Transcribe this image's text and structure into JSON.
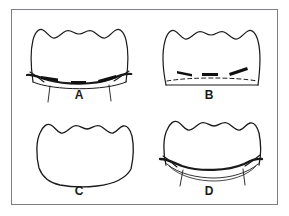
{
  "figure": {
    "layout": "2x2-panel-grid",
    "background_color": "#ffffff",
    "border_color": "#7c7f84",
    "ink_color": "#1a1a1a",
    "panels": [
      {
        "id": "a",
        "label": "A",
        "description": "Arch-shaped outline with wavy scalloped top border, crossed by a heavy dark curved band near the base with three short thick black segments and two vertical tick lines descending below",
        "features": [
          "scalloped-crest-outline",
          "heavy-curved-band",
          "three-thick-black-marks",
          "two-descending-tick-lines"
        ]
      },
      {
        "id": "b",
        "label": "B",
        "description": "Arch-shaped outline with wavy scalloped top border and a flat base, with a horizontal dashed line just above the base and three short thick black angled marks above the dashed line",
        "features": [
          "scalloped-crest-outline",
          "flat-base",
          "dashed-horizontal-line",
          "three-thick-black-marks"
        ]
      },
      {
        "id": "c",
        "label": "C",
        "description": "Plain arch-shaped outline with wavy scalloped top border and a gently curved lower border, with no internal markings",
        "features": [
          "scalloped-crest-outline",
          "plain-unmarked-interior"
        ]
      },
      {
        "id": "d",
        "label": "D",
        "description": "Arch-shaped outline with wavy scalloped top border, a heavy dark curved line across the lower region, a secondary thin curve below it, and two short vertical tick lines descending below",
        "features": [
          "scalloped-crest-outline",
          "heavy-curved-line",
          "secondary-thin-curve",
          "two-descending-tick-lines"
        ]
      }
    ]
  }
}
